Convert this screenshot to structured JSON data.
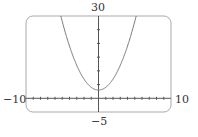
{
  "chart_data": {
    "type": "line",
    "title": "",
    "function": "y = x^2 + 3",
    "series": [
      {
        "name": "parabola",
        "x": [
          -5.2,
          -4,
          -3,
          -2,
          -1,
          0,
          1,
          2,
          3,
          4,
          5.2
        ],
        "values": [
          30,
          19,
          12,
          7,
          4,
          3,
          4,
          7,
          12,
          19,
          30
        ]
      }
    ],
    "xlim": [
      -10,
      10
    ],
    "ylim": [
      -5,
      30
    ],
    "x_tick_step": 1,
    "y_tick_step": 5,
    "grid": false,
    "xlabel": "",
    "ylabel": ""
  },
  "labels": {
    "ymax": "30",
    "ymin": "−5",
    "xmin": "−10",
    "xmax": "10"
  },
  "colors": {
    "axis": "#555555",
    "frame": "#999999",
    "curve": "#777777"
  }
}
